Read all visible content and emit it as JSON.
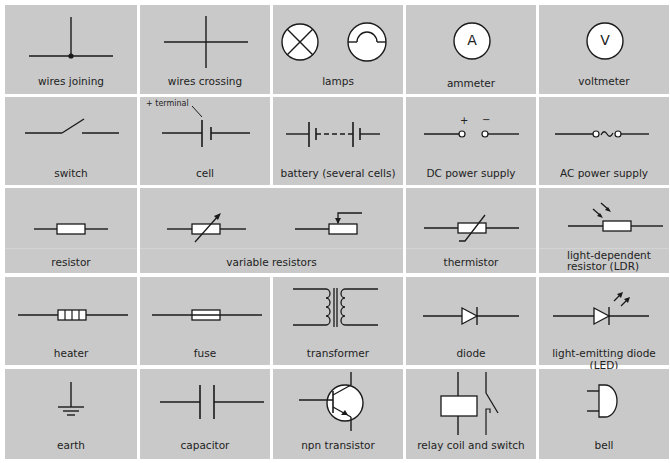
{
  "diagram": {
    "rows": [
      [
        "wires joining",
        "wires crossing",
        "lamps",
        "ammeter",
        "voltmeter"
      ],
      [
        "switch",
        "cell",
        "battery (several cells)",
        "DC power supply",
        "AC power supply"
      ],
      [
        "resistor",
        "variable resistors",
        "thermistor",
        "light-dependent resistor (LDR)"
      ],
      [
        "heater",
        "fuse",
        "transformer",
        "diode",
        "light-emitting diode (LED)"
      ],
      [
        "earth",
        "capacitor",
        "npn transistor",
        "relay coil and switch",
        "bell"
      ]
    ],
    "cells": {
      "wires_joining": "wires joining",
      "wires_crossing": "wires crossing",
      "lamps": "lamps",
      "ammeter": "ammeter",
      "ammeter_glyph": "A",
      "voltmeter": "voltmeter",
      "voltmeter_glyph": "V",
      "switch": "switch",
      "cell": "cell",
      "cell_annotation": "+ terminal",
      "battery": "battery (several cells)",
      "dc_supply": "DC power supply",
      "dc_plus": "+",
      "dc_minus": "−",
      "ac_supply": "AC power supply",
      "ac_glyph": "∼",
      "resistor": "resistor",
      "variable_resistors": "variable resistors",
      "thermistor": "thermistor",
      "ldr_line1": "light-dependent",
      "ldr_line2": "resistor (LDR)",
      "heater": "heater",
      "fuse": "fuse",
      "transformer": "transformer",
      "diode": "diode",
      "led": "light-emitting diode (LED)",
      "earth": "earth",
      "capacitor": "capacitor",
      "npn_transistor": "npn transistor",
      "relay": "relay coil and switch",
      "bell": "bell"
    },
    "colors": {
      "cell_background": "#c9c9c9",
      "grid_lines": "#ffffff",
      "stroke": "#1a1a1a"
    }
  }
}
